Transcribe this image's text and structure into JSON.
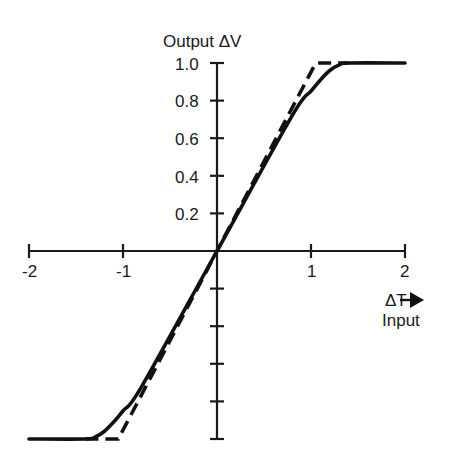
{
  "chart_data": {
    "type": "line",
    "title": "",
    "ylabel": "Output ΔV",
    "xlabel": "ΔT",
    "xlabel_sub": "Input",
    "xlim": [
      -2,
      2
    ],
    "ylim": [
      -1.0,
      1.0
    ],
    "x_ticks": [
      -2,
      -1,
      0,
      1,
      2
    ],
    "x_tick_labels": [
      "-2",
      "-1",
      "",
      "1",
      "2"
    ],
    "y_ticks": [
      -1.0,
      -0.8,
      -0.6,
      -0.4,
      -0.2,
      0,
      0.2,
      0.4,
      0.6,
      0.8,
      1.0
    ],
    "y_tick_labels": [
      "",
      "",
      "",
      "",
      "",
      "",
      "0.2",
      "0.4",
      "0.6",
      "0.8",
      "1.0"
    ],
    "grid": false,
    "legend": null,
    "series": [
      {
        "name": "actual response (solid)",
        "style": "solid",
        "x": [
          -2.0,
          -1.4,
          -1.3,
          -1.2,
          -1.1,
          -1.0,
          -0.8,
          0,
          0.8,
          1.0,
          1.1,
          1.2,
          1.3,
          1.4,
          2.0
        ],
        "y": [
          -1.0,
          -1.0,
          -0.99,
          -0.96,
          -0.91,
          -0.85,
          -0.72,
          0,
          0.72,
          0.85,
          0.91,
          0.96,
          0.99,
          1.0,
          1.0
        ]
      },
      {
        "name": "ideal piecewise-linear response (dashed)",
        "style": "dashed",
        "x": [
          -1.4,
          -1.05,
          1.05,
          1.4
        ],
        "y": [
          -1.0,
          -1.0,
          1.0,
          1.0
        ]
      }
    ]
  },
  "labels": {
    "y_title": "Output ΔV",
    "x_title": "ΔT",
    "x_sub": "Input",
    "y_ticks": [
      "1.0",
      "0.8",
      "0.6",
      "0.4",
      "0.2"
    ],
    "x_ticks": [
      "-2",
      "-1",
      "1",
      "2"
    ]
  }
}
